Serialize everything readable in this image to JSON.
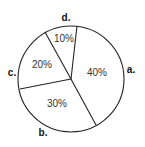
{
  "chart_data": {
    "type": "pie",
    "title": "",
    "categories": [
      "a.",
      "b.",
      "c.",
      "d."
    ],
    "values": [
      40,
      30,
      20,
      10
    ],
    "value_labels": [
      "40%",
      "30%",
      "20%",
      "10%"
    ],
    "unit": "%",
    "legend": "none",
    "style": {
      "fill": "#ffffff",
      "stroke": "#222222"
    },
    "geometry": {
      "center": [
        71,
        79
      ],
      "radius": 53,
      "boundaries": [
        {
          "between": [
            "d.",
            "a."
          ],
          "to": [
            77,
            26
          ]
        },
        {
          "between": [
            "a.",
            "b."
          ],
          "to": [
            96,
            125
          ]
        },
        {
          "between": [
            "b.",
            "c."
          ],
          "to": [
            20,
            89
          ]
        },
        {
          "between": [
            "c.",
            "d."
          ],
          "to": [
            45,
            32
          ]
        }
      ],
      "value_label_positions": [
        [
          97,
          72
        ],
        [
          57,
          103
        ],
        [
          42,
          64
        ],
        [
          64,
          38
        ]
      ],
      "category_label_positions": [
        [
          131,
          73
        ],
        [
          43,
          136
        ],
        [
          12,
          76
        ],
        [
          66,
          21
        ]
      ]
    }
  }
}
